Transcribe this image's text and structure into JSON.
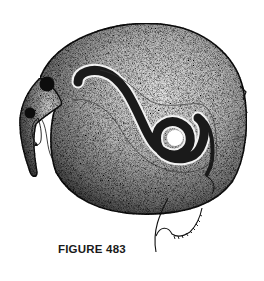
{
  "figure": {
    "caption": "FIGURE 483",
    "style": "stippled-ink-illustration",
    "colors": {
      "ink": "#111111",
      "paper": "#ffffff",
      "stipple_mid": "#8a8a8a"
    }
  }
}
